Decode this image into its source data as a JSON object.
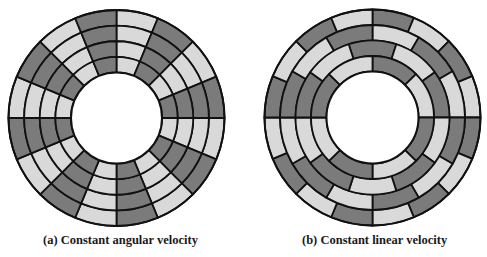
{
  "colors": {
    "dark": "#7b7b7b",
    "light": "#d9d9d9",
    "line": "#111111",
    "background": "#ffffff"
  },
  "disks": [
    {
      "id": "cav",
      "caption": "(a) Constant angular velocity",
      "center": [
        116.5,
        118
      ],
      "inner_radius": 45.5,
      "outer_radius": 108,
      "tracks": [
        {
          "track": 1,
          "sectors": 16,
          "offset_deg": 0,
          "first_shade": "light"
        },
        {
          "track": 2,
          "sectors": 16,
          "offset_deg": 0,
          "first_shade": "light"
        },
        {
          "track": 3,
          "sectors": 16,
          "offset_deg": 0,
          "first_shade": "light"
        },
        {
          "track": 4,
          "sectors": 16,
          "offset_deg": 0,
          "first_shade": "light"
        }
      ]
    },
    {
      "id": "clv",
      "caption": "(b) Constant linear velocity",
      "center": [
        372.5,
        117.5
      ],
      "inner_radius": 46,
      "outer_radius": 108,
      "tracks": [
        {
          "track": 1,
          "sectors": 16,
          "offset_deg": 0,
          "first_shade": "dark"
        },
        {
          "track": 2,
          "sectors": 12,
          "offset_deg": 0,
          "first_shade": "light"
        },
        {
          "track": 3,
          "sectors": 10,
          "offset_deg": -18,
          "first_shade": "dark"
        },
        {
          "track": 4,
          "sectors": 8,
          "offset_deg": 0,
          "first_shade": "dark"
        }
      ]
    }
  ]
}
